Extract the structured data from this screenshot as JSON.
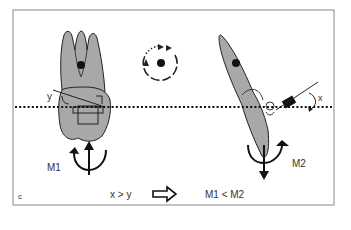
{
  "panel_label": "c",
  "labels": {
    "y_angle": "y",
    "x_angle": "x",
    "moment_left": "M1",
    "moment_right": "M2",
    "condition": "x > y",
    "result": "M1 < M2"
  },
  "colors": {
    "tooth_fill": "#a8a8a8",
    "outline": "#222222",
    "frame": "#888888",
    "background": "#ffffff"
  },
  "elements": {
    "left_tooth": "molar-with-bracket",
    "right_tooth": "tipped-incisor-with-attachment",
    "center_icon": "rotation-circle-icon",
    "reference_line": "dotted-occlusal-plane",
    "implication_arrow": "hollow-right-arrow-icon"
  }
}
